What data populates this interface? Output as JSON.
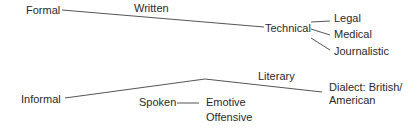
{
  "diagram": {
    "formal": {
      "root": "Formal",
      "branch_label": "Written",
      "node": "Technical",
      "children": [
        "Legal",
        "Medical",
        "Journalistic"
      ]
    },
    "informal": {
      "root": "Informal",
      "branch_label": "Literary",
      "dialect": [
        "Dialect: British/",
        "American"
      ],
      "spoken": "Spoken",
      "spoken_children": [
        "Emotive",
        "Offensive"
      ]
    },
    "line_color": "#555555"
  }
}
